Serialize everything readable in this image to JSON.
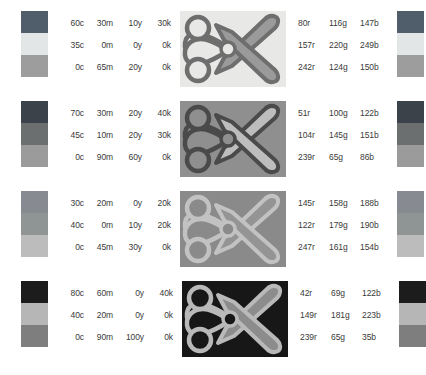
{
  "document": {
    "type": "color-separation-swatch-sheet",
    "subject": "scissors-clip-art",
    "variant_count": 4
  },
  "columns": {
    "cmyk_headers": [
      "c",
      "m",
      "y",
      "k"
    ],
    "rgb_headers": [
      "r",
      "g",
      "b"
    ]
  },
  "rows": [
    {
      "id": "variant-1",
      "cmyk": [
        [
          "60c",
          "30m",
          "10y",
          "30k"
        ],
        [
          "35c",
          "0m",
          "0y",
          "0k"
        ],
        [
          "0c",
          "65m",
          "20y",
          "0k"
        ]
      ],
      "rgb": [
        [
          "80r",
          "116g",
          "147b"
        ],
        [
          "157r",
          "220g",
          "249b"
        ],
        [
          "242r",
          "124g",
          "150b"
        ]
      ],
      "swatch_colors": [
        "#505d6b",
        "#e3e6e6",
        "#9d9d9d"
      ],
      "art": {
        "background": "#e8e8e6",
        "outline": "#6e6e6e",
        "blade": "#9a9a9a",
        "handle_fill": "#e8e8e6",
        "pivot": "#9a9a9a"
      }
    },
    {
      "id": "variant-2",
      "cmyk": [
        [
          "70c",
          "30m",
          "20y",
          "40k"
        ],
        [
          "45c",
          "10m",
          "20y",
          "30k"
        ],
        [
          "0c",
          "90m",
          "60y",
          "0k"
        ]
      ],
      "rgb": [
        [
          "51r",
          "100g",
          "122b"
        ],
        [
          "104r",
          "145g",
          "151b"
        ],
        [
          "239r",
          "65g",
          "86b"
        ]
      ],
      "swatch_colors": [
        "#3b424a",
        "#6b6f70",
        "#9b9b9b"
      ],
      "art": {
        "background": "#8f8f8f",
        "outline": "#4a4a4a",
        "blade": "#bdbdbd",
        "handle_fill": "#8f8f8f",
        "pivot": "#bdbdbd"
      }
    },
    {
      "id": "variant-3",
      "cmyk": [
        [
          "30c",
          "20m",
          "0y",
          "20k"
        ],
        [
          "40c",
          "0m",
          "10y",
          "20k"
        ],
        [
          "0c",
          "45m",
          "30y",
          "0k"
        ]
      ],
      "rgb": [
        [
          "145r",
          "158g",
          "188b"
        ],
        [
          "122r",
          "179g",
          "190b"
        ],
        [
          "247r",
          "161g",
          "154b"
        ]
      ],
      "swatch_colors": [
        "#878b91",
        "#8f9495",
        "#bcbcbc"
      ],
      "art": {
        "background": "#8a8a8a",
        "outline": "#c2c2c2",
        "blade": "#949494",
        "handle_fill": "#8a8a8a",
        "pivot": "#949494"
      }
    },
    {
      "id": "variant-4",
      "cmyk": [
        [
          "80c",
          "60m",
          "0y",
          "40k"
        ],
        [
          "40c",
          "20m",
          "0y",
          "0k"
        ],
        [
          "0c",
          "90m",
          "100y",
          "0k"
        ]
      ],
      "rgb": [
        [
          "42r",
          "69g",
          "122b"
        ],
        [
          "149r",
          "181g",
          "223b"
        ],
        [
          "239r",
          "65g",
          "35b"
        ]
      ],
      "swatch_colors": [
        "#1c1c1c",
        "#b6b6b6",
        "#7e7e7e"
      ],
      "art": {
        "background": "#171717",
        "outline": "#b9b9b9",
        "blade": "#8c8c8c",
        "handle_fill": "#171717",
        "pivot": "#8c8c8c"
      }
    }
  ]
}
